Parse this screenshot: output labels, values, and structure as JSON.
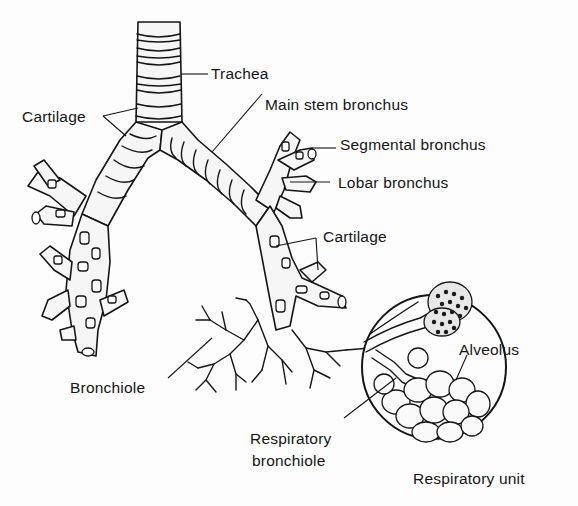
{
  "diagram": {
    "colors": {
      "ink": "#151515",
      "background": "#fdfdfd"
    },
    "labels": {
      "trachea": "Trachea",
      "cartilage_left": "Cartilage",
      "main_stem_bronchus": "Main stem bronchus",
      "segmental_bronchus": "Segmental bronchus",
      "lobar_bronchus": "Lobar bronchus",
      "cartilage_right": "Cartilage",
      "bronchiole": "Bronchiole",
      "alveolus": "Alveolus",
      "respiratory_bronchiole_line1": "Respiratory",
      "respiratory_bronchiole_line2": "bronchiole",
      "respiratory_unit": "Respiratory unit"
    }
  }
}
